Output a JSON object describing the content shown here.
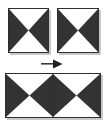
{
  "figure": {
    "background_color": "#ffffff",
    "fill_color": "#333333",
    "border_color": "#2e2e2e",
    "shadow_color": "#c9c9c9",
    "operator_label": "→",
    "operator_name": "right-arrow",
    "tiles": {
      "source_left": {
        "label": "Bowtie tile A",
        "pattern": "bowtie",
        "x": 8,
        "y": 8,
        "width": 41,
        "height": 45
      },
      "source_right": {
        "label": "Bowtie tile B",
        "pattern": "bowtie",
        "x": 57,
        "y": 8,
        "width": 42,
        "height": 45
      },
      "result": {
        "label": "Combined bowtie rectangle",
        "pattern": "double-bowtie",
        "x": 5,
        "y": 73,
        "width": 96,
        "height": 45
      }
    },
    "arrow": {
      "name": "right-arrow",
      "x": 41,
      "y": 59,
      "width": 22,
      "height": 10,
      "direction": "right"
    }
  },
  "chart_data": {
    "type": "diagram",
    "elements": [
      {
        "id": "tile-a",
        "shape": "square",
        "pattern": "bowtie",
        "fill": "#333333",
        "role": "operand"
      },
      {
        "id": "tile-b",
        "shape": "square",
        "pattern": "bowtie",
        "fill": "#333333",
        "role": "operand"
      },
      {
        "id": "arrow",
        "shape": "arrow",
        "direction": "right",
        "role": "operator"
      },
      {
        "id": "tile-result",
        "shape": "rectangle",
        "pattern": "double-bowtie",
        "fill": "#333333",
        "role": "result"
      }
    ]
  }
}
